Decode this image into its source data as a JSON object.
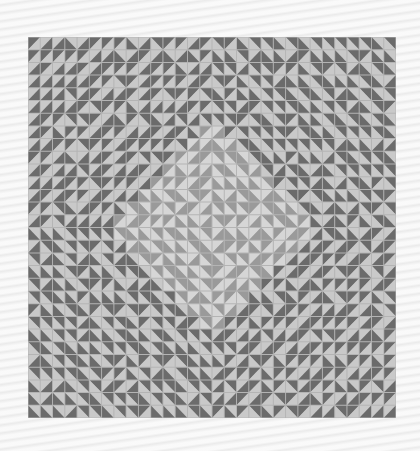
{
  "image": {
    "subject": "geometric half-square-triangle quilt pattern",
    "background_color": "#f3f3f3",
    "artwork": {
      "x": 28,
      "y": 37,
      "width": 368,
      "height": 381,
      "grid_cols": 30,
      "grid_rows": 30,
      "colors": {
        "dark": "#6b6b6b",
        "light": "#c9c9c9",
        "center_dark": "#9a9a9a",
        "center_light": "#d6d6d6",
        "grout": "#b4b4b4"
      },
      "center_diamond_radius": 9
    }
  }
}
